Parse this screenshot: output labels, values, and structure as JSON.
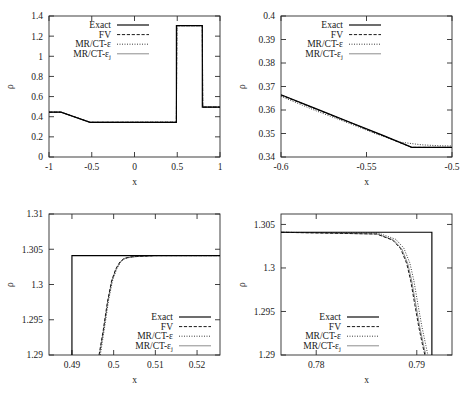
{
  "figure": {
    "axis_label_y": "ρ",
    "axis_label_x": "x"
  },
  "legend_entries": [
    {
      "label": "Exact",
      "style": "solid",
      "color": "#000000"
    },
    {
      "label": "FV",
      "style": "dashed",
      "color": "#1a1a1a"
    },
    {
      "label": "MR/CT-ε",
      "style": "dotted",
      "color": "#333333"
    },
    {
      "label": "MR/CT-ε",
      "sub": "j",
      "style": "solid-light",
      "color": "#8c8c8c"
    }
  ],
  "chart_data": [
    {
      "panel": "top-left",
      "type": "line",
      "title": "",
      "xlabel": "x",
      "ylabel": "ρ",
      "xlim": [
        -1,
        1
      ],
      "ylim": [
        0,
        1.4
      ],
      "xticks": [
        -1,
        -0.5,
        0,
        0.5,
        1
      ],
      "xticklabels": [
        "-1",
        "-0.5",
        "0",
        "0.5",
        "1"
      ],
      "yticks": [
        0,
        0.2,
        0.4,
        0.6,
        0.8,
        1,
        1.2,
        1.4
      ],
      "yticklabels": [
        "0",
        "0.2",
        "0.4",
        "0.6",
        "0.8",
        "1",
        "1.2",
        "1.4"
      ],
      "grid": false,
      "legend_position": "top-left",
      "series": [
        {
          "name": "Exact",
          "x": [
            -1,
            -0.86,
            -0.52,
            0.49,
            0.49,
            0.793,
            0.793,
            1
          ],
          "y": [
            0.445,
            0.445,
            0.3445,
            0.3445,
            1.304,
            1.304,
            0.4955,
            0.4955
          ]
        },
        {
          "name": "FV",
          "x": [
            -1,
            -0.86,
            -0.52,
            0.49,
            0.495,
            0.793,
            0.798,
            1
          ],
          "y": [
            0.445,
            0.445,
            0.3448,
            0.3452,
            1.304,
            1.304,
            0.4955,
            0.4955
          ]
        },
        {
          "name": "MR/CT-ε",
          "x": [
            -1,
            -0.86,
            -0.52,
            0.49,
            0.496,
            0.793,
            0.799,
            1
          ],
          "y": [
            0.445,
            0.445,
            0.3455,
            0.3462,
            1.3038,
            1.3038,
            0.4955,
            0.4955
          ]
        },
        {
          "name": "MR/CT-εj",
          "x": [
            -1,
            -0.86,
            -0.52,
            0.49,
            0.495,
            0.793,
            0.798,
            1
          ],
          "y": [
            0.445,
            0.445,
            0.3448,
            0.3452,
            1.304,
            1.304,
            0.4955,
            0.4955
          ]
        }
      ]
    },
    {
      "panel": "top-right",
      "type": "line",
      "title": "",
      "xlabel": "x",
      "ylabel": "ρ",
      "xlim": [
        -0.6,
        -0.5
      ],
      "ylim": [
        0.34,
        0.4
      ],
      "xticks": [
        -0.6,
        -0.55,
        -0.5
      ],
      "xticklabels": [
        "-0.6",
        "-0.55",
        "-0.5"
      ],
      "yticks": [
        0.34,
        0.35,
        0.36,
        0.37,
        0.38,
        0.39,
        0.4
      ],
      "yticklabels": [
        "0.34",
        "0.35",
        "0.36",
        "0.37",
        "0.38",
        "0.39",
        "0.4"
      ],
      "grid": false,
      "legend_position": "top-left",
      "series": [
        {
          "name": "Exact",
          "x": [
            -0.6,
            -0.58,
            -0.56,
            -0.54,
            -0.5235,
            -0.51,
            -0.5
          ],
          "y": [
            0.3665,
            0.3607,
            0.3549,
            0.3491,
            0.3441,
            0.3441,
            0.3441
          ]
        },
        {
          "name": "FV",
          "x": [
            -0.6,
            -0.58,
            -0.56,
            -0.54,
            -0.5235,
            -0.51,
            -0.5
          ],
          "y": [
            0.3663,
            0.3605,
            0.3547,
            0.3489,
            0.3441,
            0.3441,
            0.3441
          ]
        },
        {
          "name": "MR/CT-ε",
          "x": [
            -0.6,
            -0.58,
            -0.56,
            -0.545,
            -0.53,
            -0.518,
            -0.508,
            -0.5
          ],
          "y": [
            0.3658,
            0.3598,
            0.3543,
            0.35,
            0.3463,
            0.3452,
            0.3448,
            0.3447
          ]
        },
        {
          "name": "MR/CT-εj",
          "x": [
            -0.6,
            -0.58,
            -0.56,
            -0.54,
            -0.5235,
            -0.51,
            -0.5
          ],
          "y": [
            0.3664,
            0.3606,
            0.3548,
            0.349,
            0.3441,
            0.3441,
            0.3441
          ]
        }
      ]
    },
    {
      "panel": "bottom-left",
      "type": "line",
      "title": "",
      "xlabel": "x",
      "ylabel": "ρ",
      "xlim": [
        0.4845,
        0.5255
      ],
      "ylim": [
        1.29,
        1.31
      ],
      "xticks": [
        0.49,
        0.5,
        0.51,
        0.52
      ],
      "xticklabels": [
        "0.49",
        "0.5",
        "0.51",
        "0.52"
      ],
      "yticks": [
        1.29,
        1.295,
        1.3,
        1.305,
        1.31
      ],
      "yticklabels": [
        "1.29",
        "1.295",
        "1.3",
        "1.305",
        "1.31"
      ],
      "grid": false,
      "legend_position": "bottom-right",
      "series": [
        {
          "name": "Exact",
          "x": [
            0.49,
            0.49,
            0.5255
          ],
          "y": [
            1.29,
            1.3041,
            1.3041
          ]
        },
        {
          "name": "FV",
          "x": [
            0.4965,
            0.4975,
            0.4985,
            0.4995,
            0.5005,
            0.5015,
            0.5025,
            0.504,
            0.506,
            0.51,
            0.5255
          ],
          "y": [
            1.29,
            1.2935,
            1.2975,
            1.3005,
            1.3022,
            1.3032,
            1.3037,
            1.3039,
            1.304,
            1.3041,
            1.3041
          ]
        },
        {
          "name": "MR/CT-ε",
          "x": [
            0.4968,
            0.4978,
            0.4988,
            0.4998,
            0.5008,
            0.5018,
            0.5028,
            0.5043,
            0.5063,
            0.51,
            0.5255
          ],
          "y": [
            1.29,
            1.2938,
            1.2978,
            1.3007,
            1.3023,
            1.3033,
            1.3037,
            1.3039,
            1.304,
            1.3041,
            1.3041
          ]
        },
        {
          "name": "MR/CT-εj",
          "x": [
            0.4966,
            0.4976,
            0.4986,
            0.4996,
            0.5006,
            0.5016,
            0.5026,
            0.5041,
            0.5061,
            0.51,
            0.5255
          ],
          "y": [
            1.29,
            1.2936,
            1.2976,
            1.3006,
            1.3022,
            1.3032,
            1.3037,
            1.3039,
            1.304,
            1.3041,
            1.3041
          ]
        }
      ]
    },
    {
      "panel": "bottom-right",
      "type": "line",
      "title": "",
      "xlabel": "x",
      "ylabel": "ρ",
      "xlim": [
        0.7765,
        0.7935
      ],
      "ylim": [
        1.29,
        1.3062
      ],
      "xticks": [
        0.78,
        0.79
      ],
      "xticklabels": [
        "0.78",
        "0.79"
      ],
      "yticks": [
        1.29,
        1.295,
        1.3,
        1.305
      ],
      "yticklabels": [
        "1.29",
        "1.295",
        "1.3",
        "1.305"
      ],
      "grid": false,
      "legend_position": "bottom-left",
      "series": [
        {
          "name": "Exact",
          "x": [
            0.7765,
            0.7915,
            0.7915
          ],
          "y": [
            1.3041,
            1.3041,
            1.29
          ]
        },
        {
          "name": "FV",
          "x": [
            0.7765,
            0.786,
            0.7876,
            0.7884,
            0.789,
            0.7894,
            0.7898,
            0.7902,
            0.7906,
            0.7908
          ],
          "y": [
            1.3041,
            1.3039,
            1.3032,
            1.3022,
            1.3005,
            1.2985,
            1.2958,
            1.2932,
            1.291,
            1.29
          ]
        },
        {
          "name": "MR/CT-ε",
          "x": [
            0.7765,
            0.7862,
            0.7879,
            0.7887,
            0.7893,
            0.7897,
            0.7901,
            0.7905,
            0.7909,
            0.7911
          ],
          "y": [
            1.3041,
            1.304,
            1.3033,
            1.3023,
            1.3006,
            1.2986,
            1.2959,
            1.2933,
            1.2911,
            1.29
          ]
        },
        {
          "name": "MR/CT-εj",
          "x": [
            0.7765,
            0.7861,
            0.7877,
            0.7885,
            0.7891,
            0.7895,
            0.7899,
            0.7903,
            0.7907,
            0.7909
          ],
          "y": [
            1.3041,
            1.3039,
            1.3032,
            1.3022,
            1.3005,
            1.2985,
            1.2958,
            1.2932,
            1.291,
            1.29
          ]
        }
      ]
    }
  ]
}
